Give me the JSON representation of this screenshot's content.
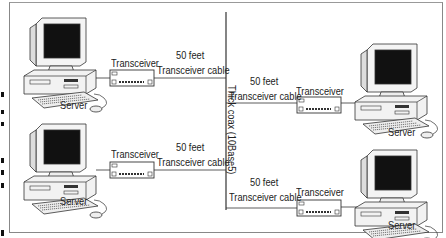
{
  "diagram": {
    "backbone": {
      "label": "Thick coax (10Base5)"
    },
    "nodes": [
      {
        "id": "server-top-left",
        "label": "Server",
        "transceiver_label": "Transceiver",
        "cable_length": "50 feet",
        "cable_label": "Transceiver cable"
      },
      {
        "id": "server-bottom-left",
        "label": "Server",
        "transceiver_label": "Transceiver",
        "cable_length": "50 feet",
        "cable_label": "Transceiver cable"
      },
      {
        "id": "server-top-right",
        "label": "Server",
        "transceiver_label": "Transceiver",
        "cable_length": "50 feet",
        "cable_label": "Transceiver cable"
      },
      {
        "id": "server-bottom-right",
        "label": "Server",
        "transceiver_label": "Transceiver",
        "cable_length": "50 feet",
        "cable_label": "Transceiver cable"
      }
    ],
    "colors": {
      "line": "#333333",
      "screen": "#111111",
      "frame": "#888888"
    }
  }
}
